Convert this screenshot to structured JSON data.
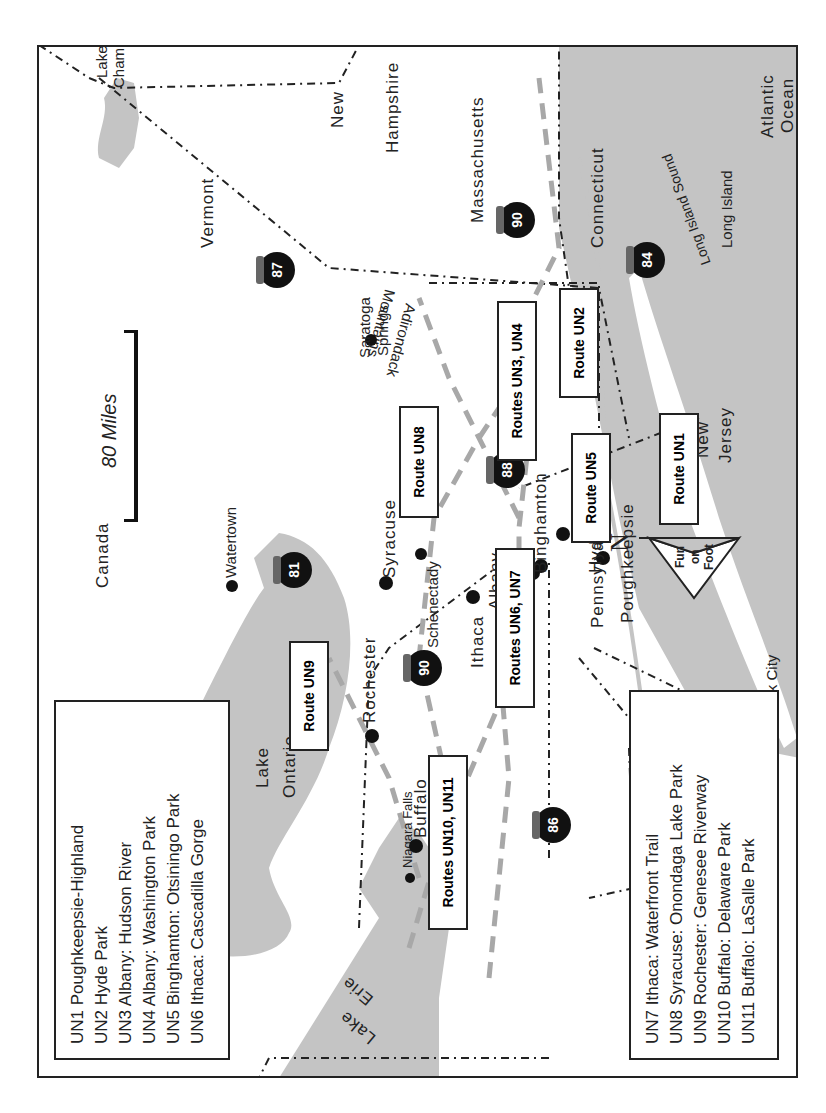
{
  "map": {
    "scale": {
      "label": "80 Miles"
    },
    "compass": {
      "north_label": "N",
      "brand_lines": [
        "Fun",
        "on",
        "Foot"
      ]
    },
    "regions": {
      "canada": "Canada",
      "vermont": "Vermont",
      "new_hampshire_1": "New",
      "new_hampshire_2": "Hampshire",
      "massachusetts": "Massachusetts",
      "connecticut": "Connecticut",
      "new_jersey_1": "New",
      "new_jersey_2": "Jersey",
      "pennsylvania": "Pennsylvania",
      "atlantic_1": "Atlantic",
      "atlantic_2": "Ocean",
      "long_island": "Long Island",
      "long_island_sound": "Long Island Sound",
      "lake_champlain_1": "Lake",
      "lake_champlain_2": "Champlain",
      "lake_ontario_1": "Lake",
      "lake_ontario_2": "Ontario",
      "lake_erie_1": "Lake",
      "lake_erie_2": "Erie",
      "adirondack_1": "Adirondack",
      "adirondack_2": "Mountains"
    },
    "cities": {
      "new_york_city": "New York City",
      "poughkeepsie": "Poughkeepsie",
      "hyde_park": "Hyde Park",
      "albany": "Albany",
      "schenectady": "Schenectady",
      "saratoga_1": "Saratoga",
      "saratoga_2": "Springs",
      "binghamton": "Binghamton",
      "syracuse": "Syracuse",
      "watertown": "Watertown",
      "ithaca": "Ithaca",
      "rochester": "Rochester",
      "niagara_falls": "Niagara Falls",
      "buffalo": "Buffalo"
    },
    "highways": [
      "87",
      "90",
      "84",
      "88",
      "81",
      "90",
      "86"
    ],
    "route_boxes": {
      "un1": "Route UN1",
      "un2": "Route UN2",
      "un3_un4": "Routes UN3, UN4",
      "un5": "Route UN5",
      "un6_un7": "Routes UN6, UN7",
      "un8": "Route UN8",
      "un9": "Route UN9",
      "un10_un11": "Routes UN10, UN11"
    }
  },
  "legend_left": [
    "UN1 Poughkeepsie-Highland",
    "UN2 Hyde Park",
    "UN3 Albany: Hudson River",
    "UN4 Albany: Washington Park",
    "UN5 Binghamton: Otsiningo Park",
    "UN6 Ithaca: Cascadilla Gorge"
  ],
  "legend_right": [
    "UN7 Ithaca: Waterfront Trail",
    "UN8 Syracuse: Onondaga Lake Park",
    "UN9 Rochester: Genesee Riverway",
    "UN10 Buffalo: Delaware Park",
    "UN11 Buffalo: LaSalle Park"
  ],
  "colors": {
    "water": "#c4c4c4",
    "route_dash": "#a8a8a8",
    "border": "#222222"
  }
}
